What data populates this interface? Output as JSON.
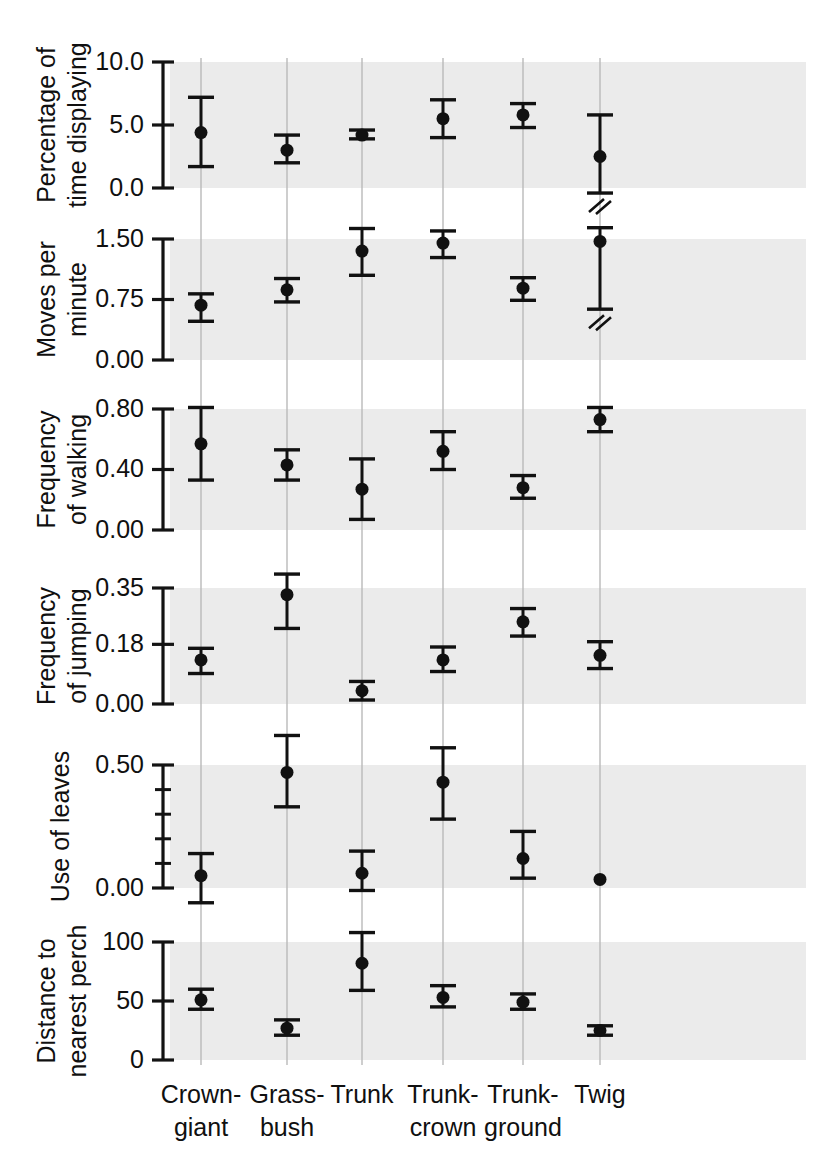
{
  "figure": {
    "background": "#ffffff",
    "band_color": "#ebebeb",
    "gridline_color": "#b9b9b9",
    "marker_color": "#111111",
    "axis_color": "#141414"
  },
  "chart_data": {
    "type": "scatter",
    "title": "",
    "xlabel": "",
    "grid": true,
    "legend": null,
    "categories": [
      "Crown-giant",
      "Grass-bush",
      "Trunk",
      "Trunk-crown",
      "Trunk-ground",
      "Twig"
    ],
    "panels": [
      {
        "ylabel": "Percentage of time displaying",
        "ylabel_lines": [
          "Percentage of",
          "time displaying"
        ],
        "ylim": [
          0.0,
          10.0
        ],
        "yticks": [
          0.0,
          5.0,
          10.0
        ],
        "ytick_labels": [
          "0.0",
          "5.0",
          "10.0"
        ],
        "minor_ticks": [],
        "values": [
          4.4,
          3.0,
          4.2,
          5.5,
          5.8,
          2.5
        ],
        "err_low": [
          1.7,
          2.0,
          3.9,
          4.0,
          4.8,
          -0.4
        ],
        "err_high": [
          7.2,
          4.2,
          4.6,
          7.0,
          6.7,
          5.8
        ],
        "axis_break": [
          false,
          false,
          false,
          false,
          false,
          true
        ],
        "no_error_bar": [
          false,
          false,
          false,
          false,
          false,
          false
        ]
      },
      {
        "ylabel": "Moves per minute",
        "ylabel_lines": [
          "Moves per",
          "minute"
        ],
        "ylim": [
          0.0,
          1.5
        ],
        "yticks": [
          0.0,
          0.75,
          1.5
        ],
        "ytick_labels": [
          "0.00",
          "0.75",
          "1.50"
        ],
        "minor_ticks": [],
        "values": [
          0.68,
          0.87,
          1.35,
          1.45,
          0.89,
          1.47
        ],
        "err_low": [
          0.48,
          0.72,
          1.05,
          1.27,
          0.74,
          0.63
        ],
        "err_high": [
          0.82,
          1.01,
          1.63,
          1.6,
          1.02,
          1.64
        ],
        "axis_break": [
          false,
          false,
          false,
          false,
          false,
          true
        ],
        "no_error_bar": [
          false,
          false,
          false,
          false,
          false,
          false
        ]
      },
      {
        "ylabel": "Frequency of walking",
        "ylabel_lines": [
          "Frequency",
          "of walking"
        ],
        "ylim": [
          0.0,
          0.8
        ],
        "yticks": [
          0.0,
          0.4,
          0.8
        ],
        "ytick_labels": [
          "0.00",
          "0.40",
          "0.80"
        ],
        "minor_ticks": [],
        "values": [
          0.57,
          0.43,
          0.27,
          0.52,
          0.28,
          0.73
        ],
        "err_low": [
          0.33,
          0.33,
          0.07,
          0.4,
          0.21,
          0.65
        ],
        "err_high": [
          0.81,
          0.53,
          0.47,
          0.65,
          0.36,
          0.81
        ],
        "axis_break": [
          false,
          false,
          false,
          false,
          false,
          false
        ],
        "no_error_bar": [
          false,
          false,
          false,
          false,
          false,
          false
        ]
      },
      {
        "ylabel": "Frequency of jumping",
        "ylabel_lines": [
          "Frequency",
          "of jumping"
        ],
        "ylim": [
          0.0,
          0.35
        ],
        "yticks": [
          0.0,
          0.18,
          0.35
        ],
        "ytick_labels": [
          "0.00",
          "0.18",
          "0.35"
        ],
        "minor_ticks": [],
        "values": [
          0.133,
          0.33,
          0.04,
          0.133,
          0.248,
          0.147
        ],
        "err_low": [
          0.092,
          0.228,
          0.012,
          0.098,
          0.205,
          0.107
        ],
        "err_high": [
          0.168,
          0.392,
          0.068,
          0.172,
          0.288,
          0.188
        ],
        "axis_break": [
          false,
          false,
          false,
          false,
          false,
          false
        ],
        "no_error_bar": [
          false,
          false,
          false,
          false,
          false,
          false
        ]
      },
      {
        "ylabel": "Use of leaves",
        "ylabel_lines": [
          "Use of leaves"
        ],
        "ylim": [
          0.0,
          0.5
        ],
        "yticks": [
          0.0,
          0.5
        ],
        "ytick_labels": [
          "0.00",
          "0.50"
        ],
        "minor_ticks": [
          0.1,
          0.2,
          0.3,
          0.4
        ],
        "values": [
          0.05,
          0.47,
          0.06,
          0.43,
          0.12,
          0.035
        ],
        "err_low": [
          -0.06,
          0.33,
          -0.01,
          0.28,
          0.04,
          0.035
        ],
        "err_high": [
          0.14,
          0.62,
          0.15,
          0.57,
          0.23,
          0.035
        ],
        "axis_break": [
          false,
          false,
          false,
          false,
          false,
          false
        ],
        "no_error_bar": [
          false,
          false,
          false,
          false,
          false,
          true
        ]
      },
      {
        "ylabel": "Distance to nearest perch",
        "ylabel_lines": [
          "Distance to",
          "nearest perch"
        ],
        "ylim": [
          0,
          100
        ],
        "yticks": [
          0,
          50,
          100
        ],
        "ytick_labels": [
          "0",
          "50",
          "100"
        ],
        "minor_ticks": [],
        "values": [
          51,
          27,
          82,
          53,
          49,
          25
        ],
        "err_low": [
          43,
          21,
          59,
          45,
          43,
          21
        ],
        "err_high": [
          60,
          34,
          108,
          63,
          56,
          29
        ],
        "axis_break": [
          false,
          false,
          false,
          false,
          false,
          false
        ],
        "no_error_bar": [
          false,
          false,
          false,
          false,
          false,
          false
        ]
      }
    ]
  }
}
